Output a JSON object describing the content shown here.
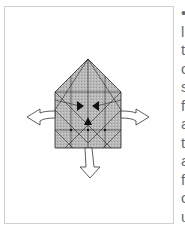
{
  "diagram": {
    "fill_color": "#b5b5b5",
    "line_color": "#222222",
    "arrows": [
      "left-outward-arrow",
      "right-outward-arrow",
      "down-outward-arrow"
    ],
    "markers": [
      "arrowhead-right",
      "arrowhead-left",
      "arrowhead-up"
    ]
  },
  "text_fragments": [
    "•",
    "l",
    "t",
    "c",
    "s",
    "f",
    "a",
    "t",
    "a",
    "f",
    "c",
    "u"
  ]
}
